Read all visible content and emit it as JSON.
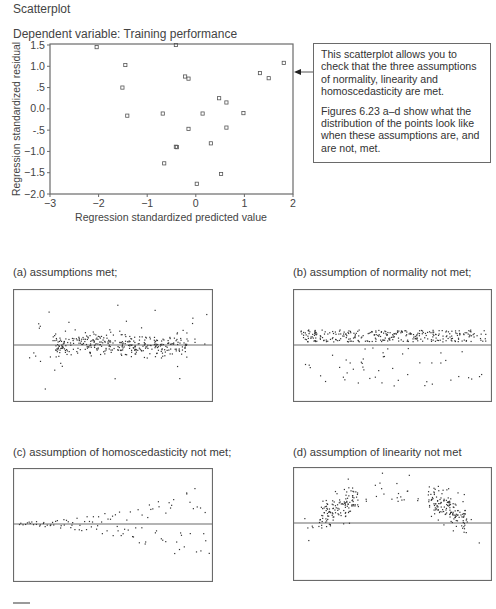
{
  "figure": {
    "title": "Scatterplot",
    "dependent_variable": "Dependent variable: Training performance"
  },
  "callout": {
    "paragraph1": "This scatterplot allows you to check that the three assumptions of normality, linearity and homoscedasticity are met.",
    "paragraph2": "Figures 6.23 a–d show what the distribution of the points look like when these assumptions are, and are not, met."
  },
  "panels": {
    "a": {
      "label": "(a)  assumptions met;"
    },
    "b": {
      "label": "(b)  assumption of normality not met;"
    },
    "c": {
      "label": "(c)  assumption of homoscedasticity not met;"
    },
    "d": {
      "label": "(d)  assumption of linearity not met"
    }
  },
  "colors": {
    "axis": "#6a6a6a",
    "marker": "#555555",
    "dot": "#333333",
    "text": "#444444"
  },
  "chart_data": [
    {
      "type": "scatter",
      "title": "Scatterplot",
      "subtitle": "Dependent variable: Training performance",
      "xlabel": "Regression standardized predicted value",
      "ylabel": "Regression standardized residual",
      "xlim": [
        -3,
        2
      ],
      "ylim": [
        -2.0,
        1.5
      ],
      "x_ticks": [
        -3,
        -2,
        -1,
        0,
        1,
        2
      ],
      "x_tick_labels": [
        "−3",
        "−2",
        "−1",
        "0",
        "1",
        "2"
      ],
      "y_ticks": [
        1.5,
        1.0,
        0.5,
        0.0,
        -0.5,
        -1.0,
        -1.5,
        -2.0
      ],
      "y_tick_labels": [
        "1.5",
        "1.0",
        ".5",
        "0.0",
        "-.5",
        "−1.0",
        "−1.5",
        "−2.0"
      ],
      "grid": false,
      "marker": "open-square",
      "annotation": {
        "type": "arrow",
        "y": 0.82,
        "points_to": "plot right edge from callout box"
      },
      "points": [
        {
          "x": -2.04,
          "y": 1.45
        },
        {
          "x": -0.41,
          "y": 1.5
        },
        {
          "x": -1.45,
          "y": 1.03
        },
        {
          "x": -1.51,
          "y": 0.5
        },
        {
          "x": -1.41,
          "y": -0.16
        },
        {
          "x": -0.22,
          "y": 0.76
        },
        {
          "x": -0.15,
          "y": 0.71
        },
        {
          "x": 1.32,
          "y": 0.84
        },
        {
          "x": 1.5,
          "y": 0.72
        },
        {
          "x": 1.81,
          "y": 1.08
        },
        {
          "x": 0.48,
          "y": 0.25
        },
        {
          "x": 0.63,
          "y": 0.15
        },
        {
          "x": -0.68,
          "y": -0.11
        },
        {
          "x": 0.14,
          "y": -0.11
        },
        {
          "x": 0.98,
          "y": -0.1
        },
        {
          "x": -0.15,
          "y": -0.47
        },
        {
          "x": 0.63,
          "y": -0.44
        },
        {
          "x": 0.31,
          "y": -0.81
        },
        {
          "x": -0.41,
          "y": -0.89
        },
        {
          "x": -0.39,
          "y": -0.9
        },
        {
          "x": -0.65,
          "y": -1.28
        },
        {
          "x": 0.52,
          "y": -1.53
        },
        {
          "x": 0.02,
          "y": -1.76
        }
      ]
    },
    {
      "type": "scatter",
      "panel": "a",
      "title": "(a) assumptions met;",
      "description": "Dense horizontal band centred on the zero line with symmetric sparse scatter above and below",
      "pattern": "normal-band",
      "n_dense": 330,
      "n_sparse": 40,
      "zero_line": true
    },
    {
      "type": "scatter",
      "panel": "b",
      "title": "(b) assumption of normality not met;",
      "description": "Dense band just above the zero line with a sparse long tail below",
      "pattern": "skewed-band",
      "n_dense": 300,
      "n_sparse": 50,
      "zero_line": true
    },
    {
      "type": "scatter",
      "panel": "c",
      "title": "(c) assumption of homoscedasticity not met;",
      "description": "Residual spread widens (fans out) from left to right",
      "pattern": "funnel",
      "n": 110,
      "zero_line": true
    },
    {
      "type": "scatter",
      "panel": "d",
      "title": "(d) assumption of linearity not met",
      "description": "Inverted-U (curvilinear) pattern of residuals with clusters on left and right",
      "pattern": "inverted-u",
      "n": 300,
      "zero_line": true
    }
  ]
}
